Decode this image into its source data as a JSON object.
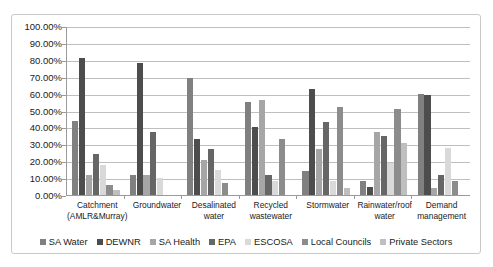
{
  "chart_data": {
    "type": "bar",
    "title": "",
    "subtitle": "",
    "xlabel": "",
    "ylabel": "",
    "ylim": [
      0,
      100
    ],
    "grid": true,
    "legend_position": "bottom",
    "value_suffix": "%",
    "categories": [
      "Catchment (AMLR&Murray)",
      "Groundwater",
      "Desalinated water",
      "Recycled wastewater",
      "Stormwater",
      "Rainwater/roof water",
      "Demand management"
    ],
    "category_lines": [
      [
        "Catchment",
        "(AMLR&Murray)"
      ],
      [
        "Groundwater"
      ],
      [
        "Desalinated",
        "water"
      ],
      [
        "Recycled",
        "wastewater"
      ],
      [
        "Stormwater"
      ],
      [
        "Rainwater/roof",
        "water"
      ],
      [
        "Demand",
        "management"
      ]
    ],
    "ytick_labels": [
      "100.00%",
      "90.00%",
      "80.00%",
      "70.00%",
      "60.00%",
      "50.00%",
      "40.00%",
      "30.00%",
      "20.00%",
      "10.00%",
      "0.00%"
    ],
    "ytick_values": [
      100,
      90,
      80,
      70,
      60,
      50,
      40,
      30,
      20,
      10,
      0
    ],
    "series": [
      {
        "name": "SA Water",
        "color": "#808080",
        "values": [
          44,
          12,
          69,
          55,
          14,
          8,
          60
        ]
      },
      {
        "name": "DEWNR",
        "color": "#4d4d4d",
        "values": [
          81,
          78,
          33,
          40,
          63,
          5,
          59
        ]
      },
      {
        "name": "SA Health",
        "color": "#a6a6a6",
        "values": [
          12,
          12,
          21,
          56,
          27,
          37,
          4
        ]
      },
      {
        "name": "EPA",
        "color": "#666666",
        "values": [
          24,
          37,
          27,
          12,
          43,
          35,
          12
        ]
      },
      {
        "name": "ESCOSA",
        "color": "#d9d9d9",
        "values": [
          18,
          10,
          15,
          8,
          8,
          19,
          28
        ]
      },
      {
        "name": "Local Councils",
        "color": "#8c8c8c",
        "values": [
          6,
          0,
          7,
          33,
          52,
          51,
          8
        ]
      },
      {
        "name": "Private Sectors",
        "color": "#bfbfbf",
        "values": [
          3,
          0,
          0,
          0,
          4,
          31,
          0
        ]
      }
    ]
  }
}
